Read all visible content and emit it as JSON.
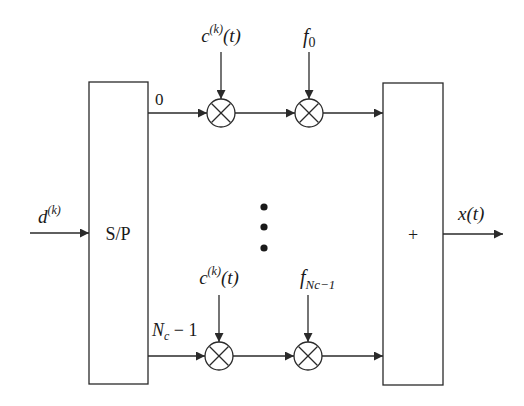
{
  "diagram": {
    "type": "block-diagram",
    "colors": {
      "line": "#2a2a2a",
      "background": "#ffffff"
    },
    "input": {
      "label_base": "d",
      "label_sup": "(k)"
    },
    "sp_block": {
      "label": "S/P"
    },
    "sum_block": {
      "label": "+"
    },
    "output": {
      "label": "x(t)"
    },
    "branches": [
      {
        "index_label": "0",
        "code_label_base": "c",
        "code_label_sup": "(k)",
        "code_label_tail": "(t)",
        "carrier_label_base": "f",
        "carrier_label_sub": "0"
      },
      {
        "index_label_base": "N",
        "index_label_sub": "c",
        "index_label_tail": " − 1",
        "code_label_base": "c",
        "code_label_sup": "(k)",
        "code_label_tail": "(t)",
        "carrier_label_base": "f",
        "carrier_label_sub": "Nc−1"
      }
    ],
    "ellipsis": "⋮",
    "multiplier_symbol": "×"
  }
}
